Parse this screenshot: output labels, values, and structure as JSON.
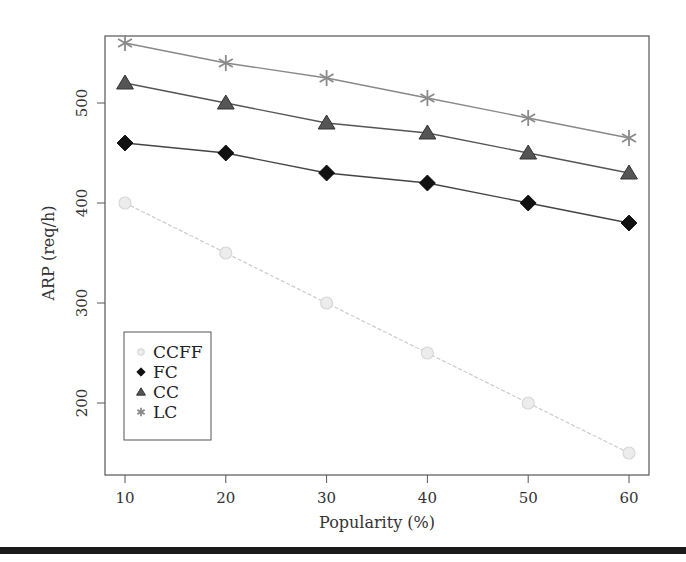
{
  "chart_data": {
    "type": "line",
    "title": "",
    "xlabel": "Popularity (%)",
    "ylabel": "ARP (req/h)",
    "x": [
      10,
      20,
      30,
      40,
      50,
      60
    ],
    "xticks": [
      10,
      20,
      30,
      40,
      50,
      60
    ],
    "yticks": [
      200,
      300,
      400,
      500
    ],
    "xlim": [
      8,
      62
    ],
    "ylim": [
      128,
      567
    ],
    "grid": false,
    "legend_position": "lower-left",
    "series": [
      {
        "name": "CCFF",
        "values": [
          400,
          350,
          300,
          250,
          200,
          150
        ],
        "marker": "circle",
        "color": "#d8d8d8",
        "line_color": "#cfcfcf",
        "line_style": "dashed"
      },
      {
        "name": "FC",
        "values": [
          460,
          450,
          430,
          420,
          400,
          380
        ],
        "marker": "diamond",
        "color": "#111111",
        "line_color": "#444444",
        "line_style": "solid"
      },
      {
        "name": "CC",
        "values": [
          520,
          500,
          480,
          470,
          450,
          430
        ],
        "marker": "triangle",
        "color": "#555555",
        "line_color": "#555555",
        "line_style": "solid"
      },
      {
        "name": "LC",
        "values": [
          560,
          540,
          525,
          505,
          485,
          465
        ],
        "marker": "asterisk",
        "color": "#8a8a8a",
        "line_color": "#888888",
        "line_style": "solid"
      }
    ]
  }
}
